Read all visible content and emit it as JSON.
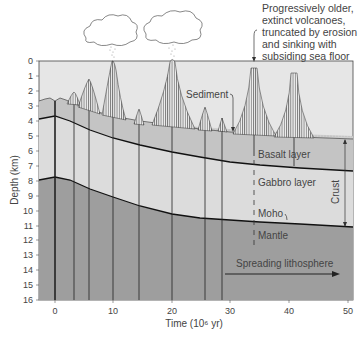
{
  "diagram": {
    "annotation": {
      "lines": [
        "Progressively older,",
        "extinct volcanoes,",
        "truncated by erosion",
        "and sinking with",
        "subsiding sea floor"
      ]
    },
    "labels": {
      "sediment": "Sediment",
      "basalt": "Basalt layer",
      "gabbro": "Gabbro layer",
      "moho": "Moho",
      "mantle": "Mantle",
      "crust": "Crust",
      "spreading": "Spreading lithosphere"
    },
    "y_axis": {
      "label": "Depth (km)",
      "ticks": [
        "0",
        "1",
        "2",
        "3",
        "4",
        "5",
        "6",
        "7",
        "8",
        "9",
        "10",
        "11",
        "12",
        "13",
        "14",
        "15",
        "16"
      ]
    },
    "x_axis": {
      "label": "Time (10⁶ yr)",
      "ticks": [
        "0",
        "10",
        "20",
        "30",
        "40",
        "50"
      ]
    },
    "colors": {
      "water": "#e6e6e6",
      "sediment": "#cfcfcf",
      "basalt": "#c4c4c4",
      "gabbro": "#dcdcdc",
      "mantle": "#9e9e9e",
      "line": "#222222"
    }
  }
}
